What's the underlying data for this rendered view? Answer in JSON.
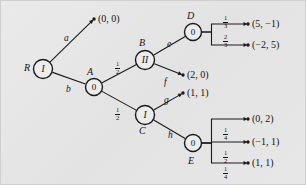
{
  "figure": {
    "background_color": "#e8e8e8",
    "line_color": "#1a1a1a"
  },
  "nodes": [
    {
      "id": "R",
      "name": "R",
      "label": "I",
      "kind": "player-1",
      "x": 42,
      "y": 68,
      "r": 9.5,
      "name_x": 24,
      "name_y": 62
    },
    {
      "id": "A",
      "name": "A",
      "label": "0",
      "kind": "chance",
      "x": 93,
      "y": 86,
      "r": 8.5,
      "name_x": 85,
      "name_y": 66
    },
    {
      "id": "B",
      "name": "B",
      "label": "II",
      "kind": "player-2",
      "x": 144,
      "y": 59,
      "r": 9.5,
      "name_x": 137,
      "name_y": 38
    },
    {
      "id": "C",
      "name": "C",
      "label": "I",
      "kind": "player-1",
      "x": 144,
      "y": 114,
      "r": 9.5,
      "name_x": 137,
      "name_y": 126
    },
    {
      "id": "D",
      "name": "D",
      "label": "0",
      "kind": "chance",
      "x": 192,
      "y": 31,
      "r": 8.5,
      "name_x": 185,
      "name_y": 12
    },
    {
      "id": "E",
      "name": "E",
      "label": "0",
      "kind": "chance",
      "x": 192,
      "y": 142,
      "r": 8.5,
      "name_x": 186,
      "name_y": 158
    }
  ],
  "edges": [
    {
      "from": "R",
      "to": "t00",
      "label": "a",
      "label_x": 64,
      "label_y": 35
    },
    {
      "from": "R",
      "to": "A",
      "label": "b",
      "label_x": 66,
      "label_y": 85
    },
    {
      "from": "A",
      "to": "B",
      "label": "",
      "prob": "1/2",
      "label_x": 0,
      "label_y": 0
    },
    {
      "from": "A",
      "to": "C",
      "label": "",
      "prob": "1/2",
      "label_x": 0,
      "label_y": 0
    },
    {
      "from": "B",
      "to": "D",
      "label": "e",
      "label_x": 165,
      "label_y": 42
    },
    {
      "from": "B",
      "to": "t20",
      "label": "f",
      "label_x": 163,
      "label_y": 78
    },
    {
      "from": "C",
      "to": "t11",
      "label": "g",
      "label_x": 163,
      "label_y": 97
    },
    {
      "from": "C",
      "to": "E",
      "label": "h",
      "label_x": 166,
      "label_y": 131
    },
    {
      "from": "D",
      "to": "t5m1",
      "prob": "1/3"
    },
    {
      "from": "D",
      "to": "tm25",
      "prob": "2/3"
    },
    {
      "from": "E",
      "to": "t02",
      "prob": "1/4"
    },
    {
      "from": "E",
      "to": "tm11",
      "prob": "1/2"
    },
    {
      "from": "E",
      "to": "t11b",
      "prob": "1/4"
    }
  ],
  "probabilities": [
    {
      "id": "p-a-b",
      "num": "1",
      "den": "2",
      "x": 114,
      "y": 60
    },
    {
      "id": "p-a-c",
      "num": "1",
      "den": "2",
      "x": 114,
      "y": 106
    },
    {
      "id": "p-d-1",
      "num": "1",
      "den": "3",
      "x": 222,
      "y": 14
    },
    {
      "id": "p-d-2",
      "num": "2",
      "den": "3",
      "x": 222,
      "y": 33
    },
    {
      "id": "p-e-1",
      "num": "1",
      "den": "4",
      "x": 222,
      "y": 126
    },
    {
      "id": "p-e-2",
      "num": "1",
      "den": "2",
      "x": 222,
      "y": 149
    },
    {
      "id": "p-e-3",
      "num": "1",
      "den": "4",
      "x": 222,
      "y": 165
    }
  ],
  "outcomes": [
    {
      "id": "t00",
      "text": "(0, 0)",
      "dot_x": 93,
      "dot_y": 18,
      "text_x": 97,
      "text_y": 13
    },
    {
      "id": "t5m1",
      "text": "(5, −1)",
      "dot_x": 247,
      "dot_y": 23,
      "text_x": 251,
      "text_y": 18
    },
    {
      "id": "tm25",
      "text": "(−2, 5)",
      "dot_x": 247,
      "dot_y": 44,
      "text_x": 251,
      "text_y": 39
    },
    {
      "id": "t20",
      "text": "(2, 0)",
      "dot_x": 182,
      "dot_y": 74,
      "text_x": 186,
      "text_y": 69
    },
    {
      "id": "t11",
      "text": "(1, 1)",
      "dot_x": 182,
      "dot_y": 92,
      "text_x": 186,
      "text_y": 87
    },
    {
      "id": "t02",
      "text": "(0, 2)",
      "dot_x": 247,
      "dot_y": 118,
      "text_x": 251,
      "text_y": 113
    },
    {
      "id": "tm11",
      "text": "(−1, 1)",
      "dot_x": 247,
      "dot_y": 141,
      "text_x": 251,
      "text_y": 136
    },
    {
      "id": "t11b",
      "text": "(1, 1)",
      "dot_x": 247,
      "dot_y": 162,
      "text_x": 251,
      "text_y": 157
    }
  ],
  "edge_labels": [
    {
      "id": "a",
      "text": "a",
      "x": 63,
      "y": 33
    },
    {
      "id": "b",
      "text": "b",
      "x": 65,
      "y": 84
    },
    {
      "id": "e",
      "text": "e",
      "x": 166,
      "y": 39
    },
    {
      "id": "f",
      "text": "f",
      "x": 163,
      "y": 77
    },
    {
      "id": "g",
      "text": "g",
      "x": 163,
      "y": 95
    },
    {
      "id": "h",
      "text": "h",
      "x": 167,
      "y": 130
    }
  ],
  "node_names": [
    {
      "id": "R",
      "text": "R",
      "x": 23,
      "y": 62
    },
    {
      "id": "A",
      "text": "A",
      "x": 86,
      "y": 66
    },
    {
      "id": "B",
      "text": "B",
      "x": 138,
      "y": 37
    },
    {
      "id": "C",
      "text": "C",
      "x": 138,
      "y": 125
    },
    {
      "id": "D",
      "text": "D",
      "x": 186,
      "y": 10
    },
    {
      "id": "E",
      "text": "E",
      "x": 187,
      "y": 155
    }
  ]
}
